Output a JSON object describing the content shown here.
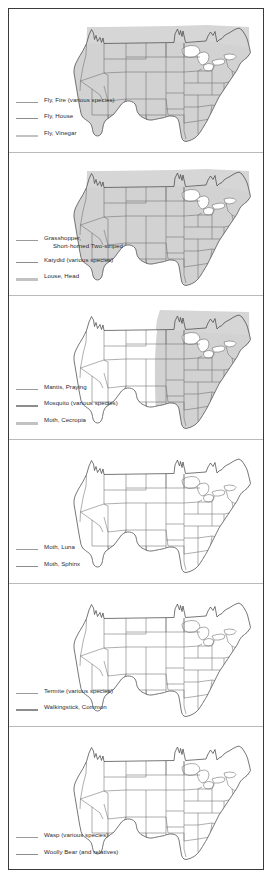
{
  "document": {
    "type": "insect-distribution-range-maps",
    "region": "United States",
    "panel_count": 6
  },
  "panels": [
    {
      "id": "panel-1",
      "shading": "full",
      "legend": [
        {
          "style": "thin",
          "label": "Fly, Fire (various species)",
          "label_line2": ""
        },
        {
          "style": "med",
          "label": "Fly, House",
          "label_line2": ""
        },
        {
          "style": "thick",
          "label": "Fly, Vinegar",
          "label_line2": ""
        }
      ]
    },
    {
      "id": "panel-2",
      "shading": "full",
      "legend": [
        {
          "style": "thin",
          "label": "Grasshopper,",
          "label_line2": "Short-horned Two-striped"
        },
        {
          "style": "med",
          "label": "Katydid  (various species)",
          "label_line2": ""
        },
        {
          "style": "thick",
          "label": "Louse, Head",
          "label_line2": ""
        }
      ]
    },
    {
      "id": "panel-3",
      "shading": "eastern",
      "legend": [
        {
          "style": "thin",
          "label": "Mantis, Praying",
          "label_line2": ""
        },
        {
          "style": "med",
          "label": "Mosquito (various species)",
          "label_line2": ""
        },
        {
          "style": "thick",
          "label": "Moth, Cecropia",
          "label_line2": ""
        }
      ]
    },
    {
      "id": "panel-4",
      "shading": "none",
      "legend": [
        {
          "style": "thin",
          "label": "Moth, Luna",
          "label_line2": ""
        },
        {
          "style": "med",
          "label": "Moth, Sphinx",
          "label_line2": ""
        }
      ]
    },
    {
      "id": "panel-5",
      "shading": "none",
      "legend": [
        {
          "style": "thin",
          "label": "Termite  (various species)",
          "label_line2": ""
        },
        {
          "style": "med",
          "label": "Walkingstick, Common",
          "label_line2": ""
        }
      ]
    },
    {
      "id": "panel-6",
      "shading": "none",
      "legend": [
        {
          "style": "thin",
          "label": "Wasp (various species)",
          "label_line2": ""
        },
        {
          "style": "med",
          "label": "Woolly Bear (and relatives)",
          "label_line2": ""
        }
      ]
    }
  ],
  "colors": {
    "frame": "#3a3a3c",
    "divider": "#b9b9bb",
    "state_outline": "#6d6d70",
    "coast_outline": "#4a4a4d",
    "shade_fill": "#d2d2d2",
    "text": "#2a2a2c",
    "page_background": "#ffffff"
  }
}
